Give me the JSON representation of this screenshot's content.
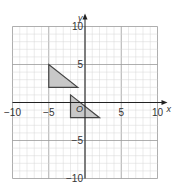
{
  "diagram": {
    "type": "coordinate-grid",
    "x_axis": {
      "label": "x",
      "min": -10,
      "max": 10,
      "ticks": [
        "-10",
        "-5",
        "5",
        "10"
      ]
    },
    "y_axis": {
      "label": "y",
      "min": -10,
      "max": 10,
      "ticks": [
        "10",
        "5",
        "-5",
        "-10"
      ]
    },
    "origin_label": "O",
    "shapes": [
      {
        "name": "triangle-A",
        "vertices": [
          [
            -5,
            5
          ],
          [
            -5,
            2
          ],
          [
            -1,
            2
          ]
        ],
        "fill": "#c8c8c8"
      },
      {
        "name": "triangle-B",
        "vertices": [
          [
            -2,
            1
          ],
          [
            -2,
            -2
          ],
          [
            2,
            -2
          ]
        ],
        "fill": "#c8c8c8"
      }
    ]
  },
  "colors": {
    "grid_minor": "#d6d6d6",
    "grid_major": "#9a9a9a",
    "axis": "#222222",
    "shape_stroke": "#444444"
  }
}
